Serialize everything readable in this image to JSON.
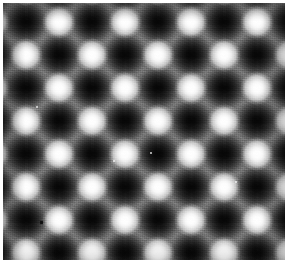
{
  "image": {
    "kind": "scanning-probe-micrograph",
    "description": "Atomic-resolution scanning probe microscopy image of a square surface lattice",
    "title": "",
    "caption": "",
    "width_px": 288,
    "height_px": 265,
    "colormap": "grayscale",
    "margin": {
      "color": "#ffffff",
      "left_px": 3,
      "top_px": 3,
      "right_px": 3,
      "bottom_px": 5
    },
    "scan_frame": {
      "left_px": 3,
      "top_px": 3,
      "width_px": 282,
      "height_px": 257
    }
  },
  "lattice": {
    "type": "checkerboard-square",
    "period_px": 66,
    "nearest_neighbor_px": 33,
    "rotation_deg": 0,
    "dark_site_origin_px": {
      "x": 26,
      "y": 22
    },
    "bright_site_origin_px": {
      "x": 59,
      "y": 22
    },
    "dark_sites_per_row": 4,
    "dark_site_rows": 4,
    "bright_sites_per_row": 4,
    "bright_site_rows": 4
  },
  "intensity": {
    "min_level": 5,
    "max_level": 255,
    "background_level": 106,
    "dark_site_level": 10,
    "bright_site_level": 252,
    "noise_amplitude": 14,
    "colors": {
      "darkest": "#050505",
      "dark_site": "#0a0a0a",
      "mid_background": "#6a6a6a",
      "bridge_gray": "#8c8c8c",
      "bright_site": "#ffffff",
      "paper": "#ffffff"
    }
  },
  "features": {
    "point_defect": {
      "label": "dark point defect",
      "x_px": 40,
      "y_px": 221,
      "size_px": 3,
      "color": "#101010"
    },
    "bright_specks": [
      {
        "x_px": 36,
        "y_px": 106
      },
      {
        "x_px": 150,
        "y_px": 152
      },
      {
        "x_px": 235,
        "y_px": 181
      },
      {
        "x_px": 113,
        "y_px": 160
      }
    ]
  },
  "annotations": {
    "scale_bar": "",
    "axis_labels": "",
    "overlay_text": ""
  }
}
